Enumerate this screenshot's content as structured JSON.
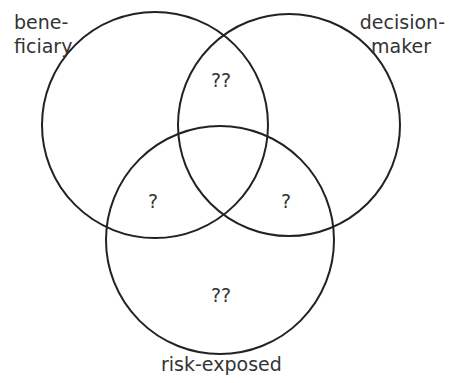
{
  "diagram": {
    "type": "venn",
    "sets": [
      {
        "id": "beneficiary",
        "label_lines": [
          "bene-",
          "ficiary"
        ]
      },
      {
        "id": "decision-maker",
        "label_lines": [
          "decision-",
          "maker"
        ]
      },
      {
        "id": "risk-exposed",
        "label_lines": [
          "risk-exposed"
        ]
      }
    ],
    "regions": {
      "beneficiary_and_decision_maker": "??",
      "beneficiary_and_risk_exposed": "?",
      "decision_maker_and_risk_exposed": "?",
      "risk_exposed_only": "??"
    },
    "stroke_color": "#222222",
    "text_color": "#333333"
  }
}
